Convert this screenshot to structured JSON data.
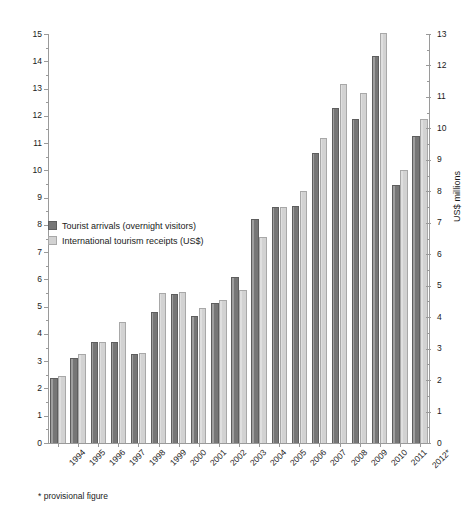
{
  "chart_data": {
    "type": "bar",
    "title": "",
    "subtitle": "",
    "xlabel": "",
    "ylabel": "Arrivals (millions)",
    "y2label": "US$ millions",
    "ylim": [
      0,
      15
    ],
    "y2lim": [
      0,
      13
    ],
    "grid": false,
    "legend_position": "inside-left",
    "footnote": "* provisional figure",
    "categories": [
      "1994",
      "1995",
      "1996",
      "1997",
      "1998",
      "1999",
      "2000",
      "2001",
      "2002",
      "2003",
      "2004",
      "2005",
      "2006",
      "2007",
      "2008",
      "2009",
      "2010",
      "2011",
      "2012*"
    ],
    "yticks": [
      0,
      1,
      2,
      3,
      4,
      5,
      6,
      7,
      8,
      9,
      10,
      11,
      12,
      13,
      14,
      15
    ],
    "y2ticks": [
      0,
      1,
      2,
      3,
      4,
      5,
      6,
      7,
      8,
      9,
      10,
      11,
      12,
      13
    ],
    "series": [
      {
        "name": "Tourist arrivals (overnight visitors)",
        "axis": "left",
        "unit": "millions",
        "color": "#767676",
        "values": [
          2.4,
          3.1,
          3.7,
          3.7,
          3.25,
          4.8,
          5.45,
          4.65,
          5.15,
          6.1,
          8.2,
          8.65,
          8.7,
          10.65,
          12.3,
          11.9,
          14.2,
          9.45,
          11.25
        ]
      },
      {
        "name": "International tourism receipts (US$)",
        "axis": "right",
        "unit": "US$ millions",
        "color": "#d2d2d2",
        "values": [
          2.1,
          2.8,
          3.2,
          3.85,
          2.85,
          4.75,
          4.8,
          4.3,
          4.55,
          4.85,
          6.55,
          7.5,
          8.0,
          9.7,
          11.4,
          11.1,
          12.4,
          8.65,
          10.3
        ]
      }
    ],
    "series_left_axis_equivalent": [
      {
        "name": "International tourism receipts (US$) — plotted height on left scale",
        "values": [
          2.45,
          3.25,
          3.7,
          4.45,
          3.3,
          5.5,
          5.55,
          4.95,
          5.25,
          5.6,
          7.55,
          8.65,
          9.25,
          11.2,
          13.15,
          12.85,
          15.05,
          10.0,
          11.9
        ]
      }
    ]
  },
  "legend": {
    "items": [
      {
        "label": "Tourist arrivals (overnight visitors)",
        "swatch": "dark"
      },
      {
        "label": "International tourism receipts (US$)",
        "swatch": "light"
      }
    ]
  },
  "axes": {
    "left_title": "Arrivals (millions)",
    "right_title": "US$ millions"
  },
  "footnote": "* provisional figure"
}
